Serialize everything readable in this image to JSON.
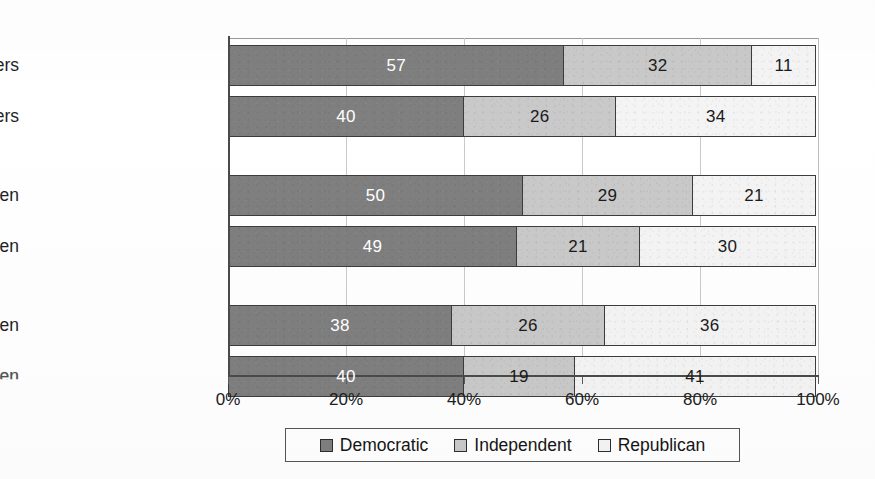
{
  "chart_data": {
    "type": "bar",
    "orientation": "horizontal",
    "stacked": true,
    "title": "",
    "xlabel": "",
    "ylabel": "",
    "xlim": [
      0,
      100
    ],
    "grid": true,
    "legend_position": "bottom",
    "categories": [
      "LGBTQ Gen Zers",
      "Straight Gen Zers",
      "Gen Z women",
      "Non–Gen Z women",
      "Gen Z men",
      "Non–Gen Z men"
    ],
    "series": [
      {
        "name": "Democratic",
        "color": "#7f7f7f",
        "values": [
          57,
          40,
          50,
          49,
          38,
          40
        ]
      },
      {
        "name": "Independent",
        "color": "#c9c9c9",
        "values": [
          32,
          26,
          29,
          21,
          26,
          19
        ]
      },
      {
        "name": "Republican",
        "color": "#f4f4f4",
        "values": [
          11,
          34,
          21,
          30,
          36,
          41
        ]
      }
    ],
    "xticks": [
      0,
      20,
      40,
      60,
      80,
      100
    ],
    "xtick_labels": [
      "0%",
      "20%",
      "40%",
      "60%",
      "80%",
      "100%"
    ],
    "group_gaps_after": [
      1,
      3
    ]
  },
  "legend": {
    "items": [
      {
        "label": "Democratic",
        "color": "#7f7f7f"
      },
      {
        "label": "Independent",
        "color": "#c9c9c9"
      },
      {
        "label": "Republican",
        "color": "#f4f4f4"
      }
    ]
  }
}
